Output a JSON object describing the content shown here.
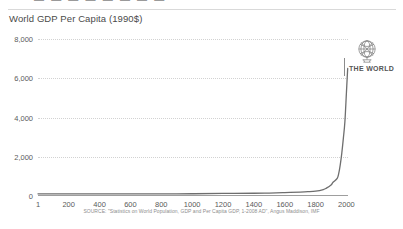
{
  "slide": {
    "clipped_header_text": "▬ ▬ ▬ ▬  ▬ ▬  ▬ ▬"
  },
  "logo": {
    "icon": "globe-icon",
    "label": "THE WORLD"
  },
  "source": {
    "text": "SOURCE: \"Statistics on World Population, GDP and Per Capita GDP, 1-2008 AD\", Angus Maddison, IMF"
  },
  "colors": {
    "curve": "#6e6e6e",
    "axis": "#9e9e9e",
    "gridline": "#d2d2d2",
    "text": "#5a5a5a",
    "title": "#4a4a4a",
    "background": "#ffffff"
  },
  "chart_data": {
    "type": "line",
    "title": "World GDP Per Capita (1990$)",
    "xlabel": "",
    "ylabel": "",
    "xlim": [
      1,
      2010
    ],
    "ylim": [
      0,
      8000
    ],
    "grid": true,
    "legend": "none",
    "ytick_labels": [
      "8,000",
      "6,000",
      "4,000",
      "2,000",
      "0"
    ],
    "ytick_values": [
      8000,
      6000,
      4000,
      2000,
      0
    ],
    "xtick_labels": [
      "1",
      "200",
      "400",
      "600",
      "800",
      "1000",
      "1200",
      "1400",
      "1600",
      "1800",
      "2000"
    ],
    "xtick_values": [
      1,
      200,
      400,
      600,
      800,
      1000,
      1200,
      1400,
      1600,
      1800,
      2000
    ],
    "series": [
      {
        "name": "World GDP Per Capita (1990$)",
        "x": [
          1,
          200,
          400,
          600,
          800,
          1000,
          1200,
          1400,
          1500,
          1600,
          1700,
          1750,
          1800,
          1850,
          1870,
          1900,
          1913,
          1940,
          1950,
          1960,
          1970,
          1980,
          1990,
          2000,
          2008
        ],
        "values": [
          110,
          110,
          105,
          105,
          110,
          115,
          130,
          140,
          150,
          170,
          200,
          220,
          250,
          330,
          400,
          560,
          700,
          900,
          1150,
          1600,
          2200,
          2950,
          3800,
          5300,
          6500
        ]
      }
    ]
  }
}
